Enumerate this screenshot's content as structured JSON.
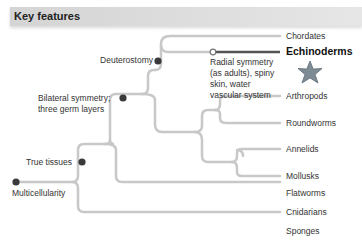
{
  "header": {
    "title": "Key features"
  },
  "nodes": {
    "deuterostomy": "Deuterostomy",
    "bilateral_line1": "Bilateral symmetry;",
    "bilateral_line2": "three germ layers",
    "true_tissues": "True tissues",
    "multicellularity": "Multicellularity",
    "radial_line1": "Radial symmetry",
    "radial_line2": "(as adults), spiny",
    "radial_line3": "skin, water",
    "radial_line4": "vascular system"
  },
  "taxa": [
    "Chordates",
    "Echinoderms",
    "Arthropods",
    "Roundworms",
    "Annelids",
    "Mollusks",
    "Flatworms",
    "Cnidarians",
    "Sponges"
  ],
  "highlight_taxon": "Echinoderms",
  "colors": {
    "branch": "#c8c8c8",
    "highlight_branch": "#555555",
    "node": "#3a3a3a",
    "starfish": "#7d8b95"
  }
}
